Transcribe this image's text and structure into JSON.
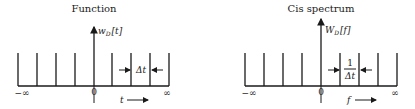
{
  "panels": [
    {
      "title": "Function",
      "amplitude_label": {
        "base": "w",
        "sub": "D",
        "arg": "[t]"
      },
      "spacing_label": "Δt",
      "axis_left": "−∞",
      "axis_origin": "0",
      "axis_right": "∞",
      "axis_variable": "t"
    },
    {
      "title": "Cis spectrum",
      "amplitude_label": {
        "base": "W",
        "sub": "D",
        "arg": "[f]"
      },
      "spacing_label_num": "1",
      "spacing_label_den": "Δt",
      "axis_left": "−∞",
      "axis_origin": "0",
      "axis_right": "∞",
      "axis_variable": "f"
    }
  ]
}
